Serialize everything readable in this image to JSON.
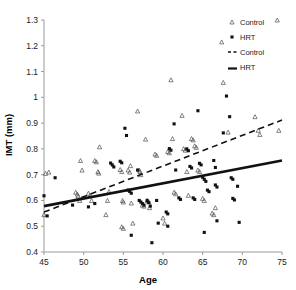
{
  "chart_data": {
    "type": "scatter",
    "title": "",
    "xlabel": "Age",
    "ylabel": "IMT (mm)",
    "xlim": [
      45,
      75
    ],
    "ylim": [
      0.4,
      1.3
    ],
    "xticks": [
      45,
      50,
      55,
      60,
      65,
      70,
      75
    ],
    "yticks": [
      0.4,
      0.5,
      0.6,
      0.7,
      0.8,
      0.9,
      1.0,
      1.1,
      1.2,
      1.3
    ],
    "ytick_labels": [
      "0.4",
      "0.5",
      "0.6",
      "0.7",
      "0.8",
      "0.9",
      "1",
      "1.1",
      "1.2",
      "1.3"
    ],
    "xtick_labels": [
      "45",
      "50",
      "55",
      "60",
      "65",
      "70",
      "75"
    ],
    "grid": false,
    "legend_position": "top-right",
    "legend": [
      {
        "label": "Control",
        "kind": "marker",
        "marker": "open-triangle",
        "color": "#4d4d4d"
      },
      {
        "label": "HRT",
        "kind": "marker",
        "marker": "filled-square",
        "color": "#111111"
      },
      {
        "label": "Control",
        "kind": "line",
        "style": "dashed",
        "color": "#111111"
      },
      {
        "label": "HRT",
        "kind": "line",
        "style": "solid",
        "color": "#111111"
      }
    ],
    "series": [
      {
        "name": "Control",
        "marker": "open-triangle",
        "color": "#4d4d4d",
        "points": [
          [
            45.0,
            0.545
          ],
          [
            45.2,
            0.705
          ],
          [
            45.6,
            0.71
          ],
          [
            49.0,
            0.632
          ],
          [
            49.2,
            0.625
          ],
          [
            49.3,
            0.618
          ],
          [
            49.5,
            0.6
          ],
          [
            49.6,
            0.755
          ],
          [
            49.8,
            0.718
          ],
          [
            50.6,
            0.628
          ],
          [
            50.8,
            0.62
          ],
          [
            51.0,
            0.6
          ],
          [
            51.4,
            0.755
          ],
          [
            51.6,
            0.75
          ],
          [
            51.8,
            0.712
          ],
          [
            51.9,
            0.706
          ],
          [
            52.0,
            0.808
          ],
          [
            52.8,
            0.545
          ],
          [
            53.0,
            0.6
          ],
          [
            53.2,
            0.635
          ],
          [
            54.6,
            0.72
          ],
          [
            54.8,
            0.712
          ],
          [
            54.9,
            0.6
          ],
          [
            55.0,
            0.594
          ],
          [
            54.8,
            0.498
          ],
          [
            55.0,
            0.492
          ],
          [
            55.6,
            0.718
          ],
          [
            55.8,
            0.71
          ],
          [
            55.9,
            0.735
          ],
          [
            56.0,
            0.59
          ],
          [
            56.2,
            0.512
          ],
          [
            56.8,
            0.947
          ],
          [
            57.0,
            0.718
          ],
          [
            57.1,
            0.712
          ],
          [
            57.2,
            0.7
          ],
          [
            57.4,
            0.582
          ],
          [
            57.6,
            0.578
          ],
          [
            57.8,
            0.838
          ],
          [
            58.0,
            0.6
          ],
          [
            58.2,
            0.594
          ],
          [
            58.3,
            0.572
          ],
          [
            59.0,
            0.78
          ],
          [
            59.2,
            0.775
          ],
          [
            60.0,
            0.532
          ],
          [
            60.2,
            0.512
          ],
          [
            60.6,
            0.79
          ],
          [
            60.8,
            0.785
          ],
          [
            61.0,
            1.068
          ],
          [
            61.2,
            0.84
          ],
          [
            61.4,
            0.632
          ],
          [
            61.6,
            0.626
          ],
          [
            62.4,
            0.93
          ],
          [
            62.6,
            0.801
          ],
          [
            62.8,
            0.795
          ],
          [
            63.0,
            0.712
          ],
          [
            63.2,
            0.62
          ],
          [
            63.6,
            0.84
          ],
          [
            63.8,
            0.835
          ],
          [
            64.0,
            0.812
          ],
          [
            64.2,
            0.806
          ],
          [
            64.4,
            0.718
          ],
          [
            64.6,
            0.712
          ],
          [
            65.0,
            0.608
          ],
          [
            65.2,
            0.6
          ],
          [
            66.2,
            0.551
          ],
          [
            66.4,
            0.545
          ],
          [
            66.6,
            0.572
          ],
          [
            67.4,
            1.215
          ],
          [
            67.6,
            1.058
          ],
          [
            68.2,
            0.865
          ],
          [
            71.6,
            0.925
          ],
          [
            72.0,
            0.872
          ],
          [
            72.2,
            0.856
          ],
          [
            74.4,
            1.3
          ],
          [
            74.6,
            0.872
          ]
        ]
      },
      {
        "name": "HRT",
        "marker": "filled-square",
        "color": "#111111",
        "points": [
          [
            45.0,
            0.618
          ],
          [
            45.4,
            0.54
          ],
          [
            46.4,
            0.688
          ],
          [
            48.6,
            0.582
          ],
          [
            50.6,
            0.575
          ],
          [
            51.4,
            0.588
          ],
          [
            53.4,
            0.745
          ],
          [
            53.6,
            0.738
          ],
          [
            53.8,
            0.73
          ],
          [
            54.6,
            0.752
          ],
          [
            54.8,
            0.746
          ],
          [
            55.2,
            0.88
          ],
          [
            55.4,
            0.852
          ],
          [
            55.6,
            0.64
          ],
          [
            55.8,
            0.635
          ],
          [
            56.0,
            0.628
          ],
          [
            56.0,
            0.465
          ],
          [
            56.8,
            0.718
          ],
          [
            57.0,
            0.6
          ],
          [
            57.2,
            0.594
          ],
          [
            57.4,
            0.588
          ],
          [
            57.6,
            0.582
          ],
          [
            58.0,
            0.6
          ],
          [
            58.2,
            0.592
          ],
          [
            58.4,
            0.578
          ],
          [
            58.6,
            0.436
          ],
          [
            59.2,
            0.6
          ],
          [
            59.4,
            0.512
          ],
          [
            60.4,
            0.555
          ],
          [
            60.6,
            0.548
          ],
          [
            60.6,
            0.5
          ],
          [
            60.8,
            0.801
          ],
          [
            61.0,
            0.795
          ],
          [
            61.4,
            0.897
          ],
          [
            61.6,
            0.718
          ],
          [
            62.0,
            0.61
          ],
          [
            62.2,
            0.604
          ],
          [
            63.0,
            0.8
          ],
          [
            63.2,
            0.793
          ],
          [
            63.4,
            0.732
          ],
          [
            63.6,
            0.726
          ],
          [
            63.8,
            0.61
          ],
          [
            64.0,
            0.604
          ],
          [
            64.4,
            0.948
          ],
          [
            64.6,
            0.744
          ],
          [
            64.8,
            0.738
          ],
          [
            65.0,
            0.69
          ],
          [
            65.2,
            0.682
          ],
          [
            65.4,
            0.674
          ],
          [
            65.2,
            0.476
          ],
          [
            65.6,
            0.64
          ],
          [
            65.8,
            0.634
          ],
          [
            66.4,
            0.755
          ],
          [
            66.6,
            0.728
          ],
          [
            66.6,
            0.66
          ],
          [
            66.8,
            0.652
          ],
          [
            66.8,
            0.521
          ],
          [
            67.6,
            0.862
          ],
          [
            68.0,
            1.005
          ],
          [
            68.4,
            0.925
          ],
          [
            68.6,
            0.688
          ],
          [
            68.8,
            0.682
          ],
          [
            68.8,
            0.608
          ],
          [
            69.0,
            0.602
          ],
          [
            69.4,
            0.655
          ],
          [
            69.6,
            0.515
          ]
        ]
      }
    ],
    "trendlines": [
      {
        "name": "Control",
        "style": "dashed",
        "color": "#111111",
        "x": [
          45,
          75
        ],
        "y": [
          0.555,
          0.912
        ]
      },
      {
        "name": "HRT",
        "style": "solid",
        "color": "#111111",
        "x": [
          45,
          75
        ],
        "y": [
          0.578,
          0.755
        ]
      }
    ]
  }
}
